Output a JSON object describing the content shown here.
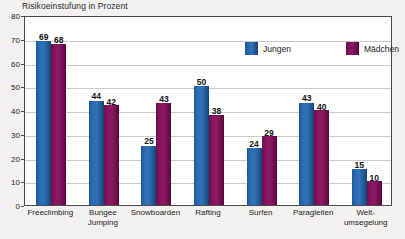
{
  "chart_data": {
    "type": "bar",
    "title": "Risikoeinstufung in Prozent",
    "xlabel": "",
    "ylabel": "",
    "ylim": [
      0,
      80
    ],
    "yticks": [
      0,
      10,
      20,
      30,
      40,
      50,
      60,
      70,
      80
    ],
    "grid": true,
    "legend_position": "top-right",
    "categories": [
      "Freeclimbing",
      "Bungee Jumping",
      "Snowboarden",
      "Rafting",
      "Surfen",
      "Paragleiten",
      "Welt- umsegelung"
    ],
    "category_lines": [
      [
        "Freeclimbing"
      ],
      [
        "Bungee",
        "Jumping"
      ],
      [
        "Snowboarden"
      ],
      [
        "Rafting"
      ],
      [
        "Surfen"
      ],
      [
        "Paragleiten"
      ],
      [
        "Welt-",
        "umsegelung"
      ]
    ],
    "series": [
      {
        "name": "Jungen",
        "color": "#2f72b8",
        "values": [
          69,
          44,
          25,
          50,
          24,
          43,
          15
        ]
      },
      {
        "name": "Mädchen",
        "color": "#8c1a64",
        "values": [
          68,
          42,
          43,
          38,
          29,
          40,
          10
        ]
      }
    ]
  },
  "legend": {
    "entries": [
      {
        "label": "Jungen"
      },
      {
        "label": "Mädchen"
      }
    ]
  },
  "colors": {
    "jungen": "#2f72b8",
    "maedchen": "#8c1a64",
    "background": "#f2f1ef",
    "plot_background": "#ffffff",
    "gridline": "#c9c9c9",
    "frame": "#4a4a4a",
    "text": "#1b1b1b"
  }
}
